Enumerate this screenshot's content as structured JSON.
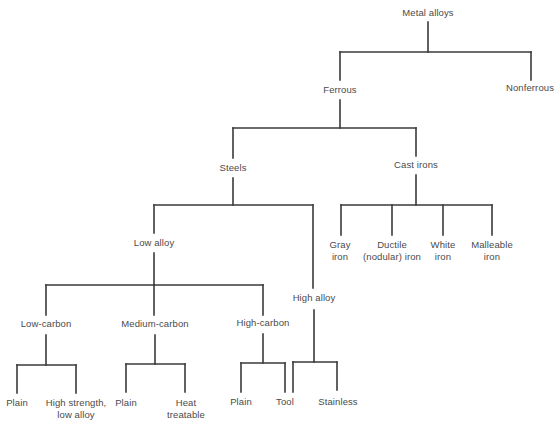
{
  "diagram": {
    "line_color": "#3a3a3a",
    "text_color": "#4a4a4a",
    "nodes": {
      "metal_alloys": {
        "label": "Metal alloys"
      },
      "ferrous": {
        "label": "Ferrous"
      },
      "nonferrous": {
        "label": "Nonferrous"
      },
      "steels": {
        "label": "Steels"
      },
      "cast_irons": {
        "label": "Cast irons"
      },
      "low_alloy": {
        "label": "Low alloy"
      },
      "high_alloy": {
        "label": "High alloy"
      },
      "gray_iron": {
        "line1": "Gray",
        "line2": "iron"
      },
      "ductile_iron": {
        "line1": "Ductile",
        "line2": "(nodular) iron"
      },
      "white_iron": {
        "line1": "White",
        "line2": "iron"
      },
      "malleable_iron": {
        "line1": "Malleable",
        "line2": "iron"
      },
      "low_carbon": {
        "label": "Low-carbon"
      },
      "medium_carbon": {
        "label": "Medium-carbon"
      },
      "high_carbon": {
        "label": "High-carbon"
      },
      "low_carbon_plain": {
        "label": "Plain"
      },
      "hsla": {
        "line1": "High strength,",
        "line2": "low alloy"
      },
      "medium_carbon_plain": {
        "label": "Plain"
      },
      "heat_treatable": {
        "line1": "Heat",
        "line2": "treatable"
      },
      "high_carbon_plain": {
        "label": "Plain"
      },
      "tool": {
        "label": "Tool"
      },
      "stainless": {
        "label": "Stainless"
      }
    },
    "edges": [
      [
        "Metal alloys",
        "Ferrous"
      ],
      [
        "Metal alloys",
        "Nonferrous"
      ],
      [
        "Ferrous",
        "Steels"
      ],
      [
        "Ferrous",
        "Cast irons"
      ],
      [
        "Steels",
        "Low alloy"
      ],
      [
        "Steels",
        "High alloy"
      ],
      [
        "Cast irons",
        "Gray iron"
      ],
      [
        "Cast irons",
        "Ductile (nodular) iron"
      ],
      [
        "Cast irons",
        "White iron"
      ],
      [
        "Cast irons",
        "Malleable iron"
      ],
      [
        "Low alloy",
        "Low-carbon"
      ],
      [
        "Low alloy",
        "Medium-carbon"
      ],
      [
        "Low alloy",
        "High-carbon"
      ],
      [
        "Low-carbon",
        "Plain"
      ],
      [
        "Low-carbon",
        "High strength, low alloy"
      ],
      [
        "Medium-carbon",
        "Plain"
      ],
      [
        "Medium-carbon",
        "Heat treatable"
      ],
      [
        "High-carbon",
        "Plain"
      ],
      [
        "High-carbon",
        "Tool"
      ],
      [
        "High alloy",
        "Tool"
      ],
      [
        "High alloy",
        "Stainless"
      ]
    ]
  }
}
